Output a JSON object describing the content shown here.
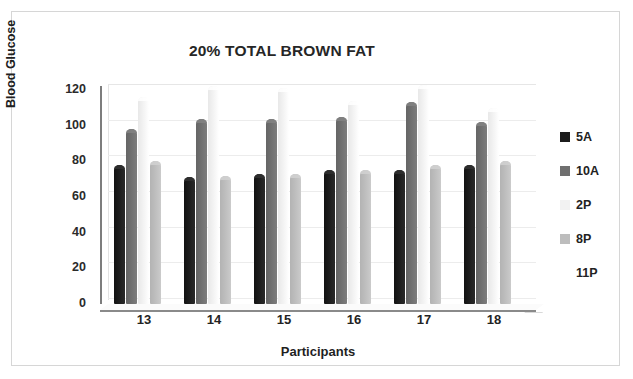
{
  "chart_data": {
    "type": "bar",
    "title": "20% TOTAL BROWN FAT",
    "xlabel": "Participants",
    "ylabel": "Blood Glucose",
    "categories": [
      "13",
      "14",
      "15",
      "16",
      "17",
      "18"
    ],
    "ylim": [
      0,
      120
    ],
    "yticks": [
      "0",
      "20",
      "40",
      "60",
      "80",
      "100",
      "120"
    ],
    "grid": true,
    "legend_position": "right",
    "series": [
      {
        "name": "5A",
        "color": "#1c1c1c",
        "values": [
          78,
          71,
          73,
          75,
          75,
          78
        ]
      },
      {
        "name": "10A",
        "color": "#6f6f6f",
        "values": [
          98,
          104,
          104,
          105,
          113,
          102
        ]
      },
      {
        "name": "2P",
        "color": "#f2f2f2",
        "values": [
          116,
          122,
          121,
          114,
          123,
          110
        ]
      },
      {
        "name": "8P",
        "color": "#bdbdbd",
        "values": [
          80,
          72,
          73,
          75,
          78,
          80
        ]
      },
      {
        "name": "11P",
        "color": "#ffffff",
        "values": [
          0,
          0,
          0,
          0,
          0,
          0
        ]
      }
    ]
  }
}
